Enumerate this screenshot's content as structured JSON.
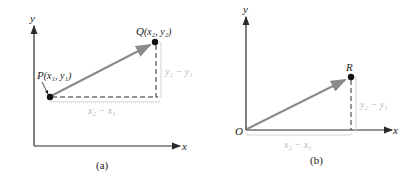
{
  "colors": {
    "axis": "#2a2a2a",
    "vector": "#8a8a8a",
    "dashed": "#2a2a2a",
    "dim_label": "#b8b8b8",
    "point": "#111111"
  },
  "panel_a": {
    "caption": "(a)",
    "axis_x_label": "x",
    "axis_y_label": "y",
    "point_p": {
      "name": "P",
      "coords": "(x₁, y₁)"
    },
    "point_q": {
      "name": "Q",
      "coords": "(x₂, y₂)"
    },
    "horizontal_diff": "x₂ − x₁",
    "vertical_diff": "y₂ − y₁"
  },
  "panel_b": {
    "caption": "(b)",
    "axis_x_label": "x",
    "axis_y_label": "y",
    "origin_label": "O",
    "point_r": {
      "name": "R"
    },
    "horizontal_diff": "x₂ − x₁",
    "vertical_diff": "y₂ − y₁"
  }
}
